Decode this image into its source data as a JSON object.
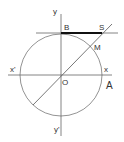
{
  "diagram": {
    "title": "",
    "type": "trigonometric-circle",
    "colors": {
      "line": "#555555",
      "circle": "#777777",
      "highlight": "#111111",
      "text": "#333333"
    },
    "labels": {
      "y": "y",
      "y_prime": "y'",
      "x": "x",
      "x_prime": "x'",
      "origin": "O",
      "A": "A",
      "B": "B",
      "S": "S",
      "M": "M"
    }
  }
}
